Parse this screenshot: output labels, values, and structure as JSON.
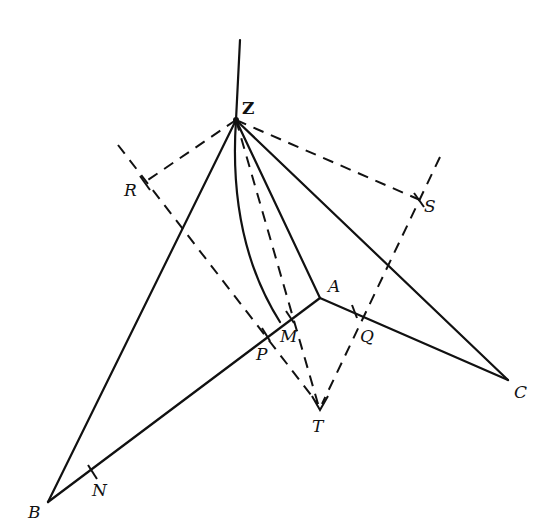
{
  "diagram": {
    "type": "geometric construction",
    "points": {
      "Z": {
        "label": "Z",
        "x": 236,
        "y": 120
      },
      "A": {
        "label": "A",
        "x": 320,
        "y": 298
      },
      "B": {
        "label": "B",
        "x": 48,
        "y": 502
      },
      "C": {
        "label": "C",
        "x": 508,
        "y": 380
      },
      "T": {
        "label": "T",
        "x": 320,
        "y": 410
      },
      "M": {
        "label": "M",
        "x": 290,
        "y": 318
      },
      "P": {
        "label": "P",
        "x": 266,
        "y": 335
      },
      "Q": {
        "label": "Q",
        "x": 355,
        "y": 311
      },
      "N": {
        "label": "N",
        "x": 92,
        "y": 472
      },
      "R": {
        "label": "R",
        "x": 145,
        "y": 182
      },
      "S": {
        "label": "S",
        "x": 420,
        "y": 200
      }
    },
    "labels": {
      "Z": "Z",
      "A": "A",
      "B": "B",
      "C": "C",
      "T": "T",
      "M": "M",
      "P": "P",
      "Q": "Q",
      "N": "N",
      "R": "R",
      "S": "S"
    },
    "solid_segments": [
      "Z-top",
      "ZB",
      "ZA",
      "ZC",
      "BA",
      "AC",
      "arc ZM"
    ],
    "dashed_segments": [
      "ZR",
      "ZS",
      "ZT",
      "R-line to T",
      "S-line to T"
    ]
  }
}
